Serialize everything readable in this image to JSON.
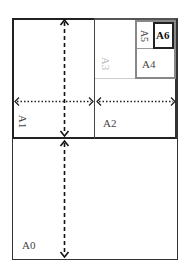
{
  "diagram": {
    "sheets": [
      {
        "id": "A0",
        "label": "A0",
        "orientation": "horizontal"
      },
      {
        "id": "A1",
        "label": "A1",
        "orientation": "rotated"
      },
      {
        "id": "A2",
        "label": "A2",
        "orientation": "horizontal"
      },
      {
        "id": "A3",
        "label": "A3",
        "orientation": "rotated"
      },
      {
        "id": "A4",
        "label": "A4",
        "orientation": "horizontal"
      },
      {
        "id": "A5",
        "label": "A5",
        "orientation": "rotated"
      },
      {
        "id": "A6",
        "label": "A6",
        "orientation": "horizontal"
      }
    ],
    "arrows": [
      {
        "name": "vertical-dashed-top",
        "style": "dashed",
        "direction": "double"
      },
      {
        "name": "vertical-dashed-bottom",
        "style": "dashed",
        "direction": "double"
      },
      {
        "name": "horizontal-dotted-left",
        "style": "dotted",
        "direction": "double"
      },
      {
        "name": "horizontal-dotted-right",
        "style": "dotted",
        "direction": "double"
      }
    ],
    "colors": {
      "border_dark": "#222222",
      "border_gray": "#888888",
      "border_light": "#cccccc",
      "label_a3": "#bbbbbb",
      "label_default": "#444444"
    }
  }
}
